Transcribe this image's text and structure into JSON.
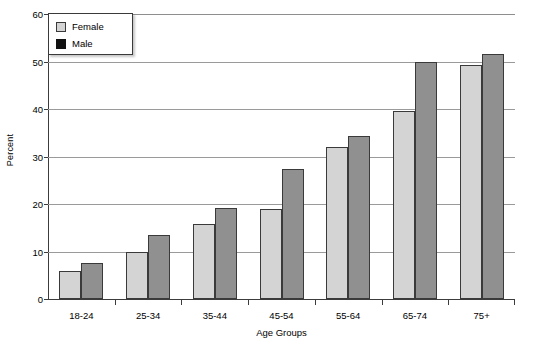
{
  "chart_data": {
    "type": "bar",
    "title": "",
    "xlabel": "Age Groups",
    "ylabel": "Percent",
    "categories": [
      "18-24",
      "25-34",
      "35-44",
      "45-54",
      "55-64",
      "65-74",
      "75+"
    ],
    "series": [
      {
        "name": "Female",
        "color": "#d4d4d4",
        "values": [
          5.8,
          10.0,
          15.8,
          18.9,
          31.9,
          39.5,
          49.2
        ]
      },
      {
        "name": "Male",
        "color": "#909090",
        "values": [
          7.6,
          13.5,
          19.2,
          27.4,
          34.3,
          49.8,
          51.5
        ]
      }
    ],
    "ylim": [
      0,
      60
    ],
    "yticks": [
      0,
      10,
      20,
      30,
      40,
      50,
      60
    ],
    "ytick_labels": [
      "0",
      "10",
      "20",
      "30",
      "40",
      "50",
      "60"
    ],
    "grid": "horizontal",
    "legend_position": "top-left",
    "legend_swatch_colors": {
      "Female": "#d4d4d4",
      "Male": "#111111"
    }
  },
  "legend": {
    "items": [
      {
        "label": "Female",
        "swatch": "female-swatch"
      },
      {
        "label": "Male",
        "swatch": "male-swatch"
      }
    ]
  },
  "axes": {
    "x_title": "Age Groups",
    "y_title": "Percent"
  }
}
